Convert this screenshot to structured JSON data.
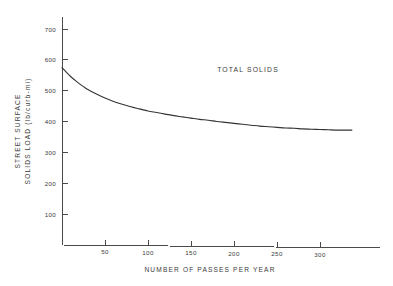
{
  "chart_data": {
    "type": "line",
    "title": "",
    "annotation": "TOTAL SOLIDS",
    "xlabel": "NUMBER OF PASSES PER YEAR",
    "ylabel_line1": "STREET SURFACE",
    "ylabel_line2": "SOLIDS LOAD (lb/curb-mi)",
    "xlim": [
      0,
      340
    ],
    "ylim": [
      0,
      760
    ],
    "xticks": [
      50,
      100,
      150,
      200,
      250,
      300
    ],
    "xtick_labels": [
      "50",
      "100",
      "150",
      "200",
      "250",
      "300"
    ],
    "yticks": [
      100,
      200,
      300,
      400,
      500,
      600,
      700
    ],
    "ytick_labels": [
      "100",
      "200",
      "300",
      "400",
      "500",
      "600",
      "700"
    ],
    "grid": false,
    "legend": "none",
    "series": [
      {
        "name": "TOTAL SOLIDS",
        "x": [
          0,
          5,
          10,
          15,
          20,
          25,
          30,
          40,
          50,
          60,
          70,
          80,
          90,
          100,
          110,
          120,
          130,
          140,
          150,
          160,
          170,
          180,
          190,
          200,
          210,
          220,
          230,
          240,
          250,
          260,
          270,
          280,
          290,
          300,
          310,
          320,
          330,
          337
        ],
        "values": [
          575,
          560,
          546,
          534,
          523,
          513,
          504,
          489,
          476,
          465,
          456,
          448,
          441,
          434,
          429,
          424,
          419,
          415,
          411,
          407,
          404,
          400,
          397,
          394,
          391,
          388,
          385,
          383,
          381,
          379,
          378,
          376,
          375,
          374,
          373,
          372,
          372,
          372
        ]
      }
    ],
    "colors": {
      "curve": "#333333",
      "axis": "#4a4a4a",
      "text": "#3a3a3a",
      "background": "#ffffff"
    }
  }
}
